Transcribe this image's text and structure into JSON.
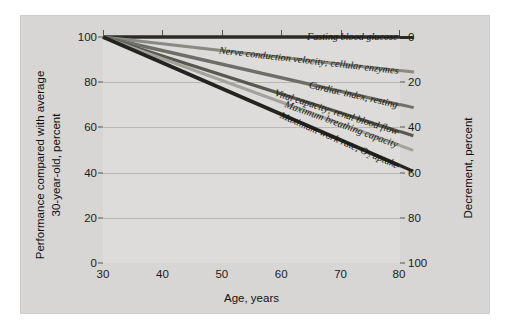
{
  "chart_data": {
    "type": "line",
    "title": "",
    "xlabel": "Age, years",
    "ylabel": "Performance compared with average 30-year-old, percent",
    "ylabel_right": "Decrement, percent",
    "x": [
      30,
      80
    ],
    "xlim": [
      30,
      80
    ],
    "ylim": [
      0,
      100
    ],
    "xticks": [
      30,
      40,
      50,
      60,
      70,
      80
    ],
    "yticks": [
      0,
      20,
      40,
      60,
      80,
      100
    ],
    "yticks_right": [
      0,
      20,
      40,
      60,
      80,
      100
    ],
    "grid": true,
    "legend_position": "inline-right-end-labels",
    "series": [
      {
        "name": "Fasting blood glucose",
        "values": [
          100,
          100
        ],
        "color": "#2b2b28",
        "width": 3.6,
        "end_decrement": 0
      },
      {
        "name": "Nerve conduction velocity; cellular enzymes",
        "values": [
          100,
          85
        ],
        "color": "#8a8a84",
        "width": 3.2,
        "end_decrement": 15
      },
      {
        "name": "Cardiac index, resting",
        "values": [
          100,
          70
        ],
        "color": "#6e6e68",
        "width": 3.4,
        "end_decrement": 30
      },
      {
        "name": "Vital capacity; renal blood flow",
        "values": [
          100,
          58
        ],
        "color": "#58584f",
        "width": 3.4,
        "end_decrement": 42
      },
      {
        "name": "Maximum breathing capacity",
        "values": [
          100,
          52
        ],
        "color": "#a3a39c",
        "width": 3.2,
        "end_decrement": 48
      },
      {
        "name": "Maximum work rate, O₂ uptake",
        "values": [
          100,
          43
        ],
        "color": "#232320",
        "width": 3.8,
        "end_decrement": 57
      }
    ],
    "colors": {
      "panel_background": "#d7d6d4",
      "plot_background": "#dddcda",
      "gridline": "#b9b8b5",
      "axis": "#55554f",
      "text": "#1b1b1b"
    }
  },
  "axes": {
    "left_title_line1": "Performance compared with average",
    "left_title_line2": "30-year-old, percent",
    "right_title": "Decrement, percent",
    "bottom_title": "Age, years",
    "left_ticks": [
      "100",
      "80",
      "60",
      "40",
      "20",
      "0"
    ],
    "right_ticks": [
      "0",
      "20",
      "40",
      "60",
      "80",
      "100"
    ],
    "bottom_ticks": [
      "30",
      "40",
      "50",
      "60",
      "70",
      "80"
    ]
  },
  "series_labels": [
    "Fasting blood glucose",
    "Nerve conduction velocity; cellular enzymes",
    "Cardiac index, resting",
    "Vital capacity; renal blood flow",
    "Maximum breathing capacity",
    "Maximum work rate, O₂ uptake"
  ]
}
